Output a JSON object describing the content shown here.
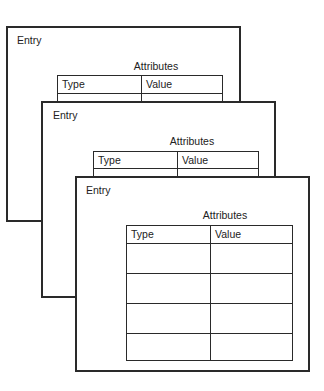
{
  "diagram": {
    "cards": [
      {
        "title": "Entry",
        "table_caption": "Attributes",
        "columns": [
          "Type",
          "Value"
        ],
        "visible_body_rows": 0
      },
      {
        "title": "Entry",
        "table_caption": "Attributes",
        "columns": [
          "Type",
          "Value"
        ],
        "visible_body_rows": 0
      },
      {
        "title": "Entry",
        "table_caption": "Attributes",
        "columns": [
          "Type",
          "Value"
        ],
        "visible_body_rows": 4,
        "rows": [
          [
            "",
            ""
          ],
          [
            "",
            ""
          ],
          [
            "",
            ""
          ],
          [
            "",
            ""
          ]
        ]
      }
    ]
  }
}
